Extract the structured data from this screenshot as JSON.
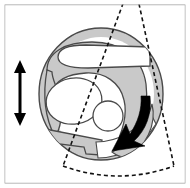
{
  "figure": {
    "canvas": {
      "width": 190,
      "height": 188,
      "background": "#ffffff"
    },
    "frame": {
      "name": "panel-border",
      "x": 4,
      "y": 4,
      "width": 182,
      "height": 180,
      "stroke": "#9a9a9a",
      "stroke_width": 1.2,
      "fill": "#ffffff"
    },
    "palette": {
      "tissue_fill": "#c9c9c9",
      "tissue_stroke": "#4a4a4a",
      "cavity_fill": "#ffffff",
      "arrow_solid": "#000000",
      "dashed_stroke": "#111111",
      "frame_stroke": "#9a9a9a",
      "band_fill": "#c9c9c9"
    },
    "body_outline": {
      "name": "outer-ring",
      "shape": "ellipse",
      "cx": 101,
      "cy": 94,
      "rx": 62,
      "ry": 66,
      "fill": "#c9c9c9",
      "stroke": "#4a4a4a",
      "stroke_width": 1.3
    },
    "cavities": [
      {
        "name": "upper-chamber",
        "shape": "rounded-lobe",
        "cx": 84,
        "cy": 57,
        "rx": 40,
        "ry": 14,
        "fill": "#ffffff"
      },
      {
        "name": "large-oval-chamber",
        "shape": "ellipse",
        "cx": 72,
        "cy": 100,
        "rx": 28,
        "ry": 23,
        "rotation": -12,
        "fill": "#ffffff"
      },
      {
        "name": "small-round-chamber",
        "shape": "circle",
        "cx": 107,
        "cy": 116,
        "r": 15,
        "fill": "#ffffff"
      },
      {
        "name": "lower-left-band",
        "shape": "wedge-band",
        "fill": "#c9c9c9"
      }
    ],
    "sector_overlay": {
      "name": "scan-sector",
      "style": "dashed",
      "stroke": "#111111",
      "stroke_width": 1.6,
      "dash_array": "4,3",
      "apex": {
        "x": 128,
        "y": -10
      },
      "left_edge_end": {
        "x": 63,
        "y": 166
      },
      "right_edge_end": {
        "x": 174,
        "y": 166
      },
      "arc_sagitta": 10
    },
    "arrows": [
      {
        "name": "vertical-double-arrow",
        "type": "double-headed",
        "orientation": "vertical",
        "x": 20,
        "y_top": 60,
        "y_bottom": 126,
        "color": "#000000",
        "shaft_width": 3,
        "head_width": 12,
        "head_length": 13
      },
      {
        "name": "curved-rotation-arrow",
        "type": "curved-single-headed",
        "direction": "down-left",
        "color": "#000000",
        "tail": {
          "x": 148,
          "y": 99
        },
        "tip": {
          "x": 113,
          "y": 148
        }
      }
    ]
  }
}
